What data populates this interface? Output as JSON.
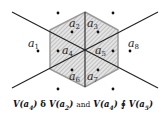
{
  "figure": {
    "points": [
      {
        "id": "a1",
        "label": "a",
        "sub": "1",
        "region": "outside-left"
      },
      {
        "id": "a2",
        "label": "a",
        "sub": "2",
        "region": "hexagon-upper-left"
      },
      {
        "id": "a3",
        "label": "a",
        "sub": "3",
        "region": "hexagon-upper-right"
      },
      {
        "id": "a4",
        "label": "a",
        "sub": "4",
        "region": "hexagon-left"
      },
      {
        "id": "a5",
        "label": "a",
        "sub": "5",
        "region": "hexagon-right"
      },
      {
        "id": "a6",
        "label": "a",
        "sub": "6",
        "region": "hexagon-lower-left"
      },
      {
        "id": "a7",
        "label": "a",
        "sub": "7",
        "region": "hexagon-lower-right"
      },
      {
        "id": "a8",
        "label": "a",
        "sub": "8",
        "region": "outside-right"
      }
    ],
    "colors": {
      "hexagon_fill": "#d9d9d9",
      "hexagon_stroke": "#9a9a9a",
      "lines": "#222222",
      "points": "#111111"
    }
  },
  "caption": {
    "part1_V": "V(",
    "part1_arg": "a",
    "part1_sub": "4",
    "part1_close": ")",
    "rel1": "δ",
    "part2_V": "V(",
    "part2_arg": "a",
    "part2_sub": "2",
    "part2_close": ")",
    "and": "and",
    "part3_V": "V(",
    "part3_arg": "a",
    "part3_sub": "4",
    "part3_close": ")",
    "rel2": "∮",
    "part4_V": "V(",
    "part4_arg": "a",
    "part4_sub": "5",
    "part4_close": ")"
  }
}
